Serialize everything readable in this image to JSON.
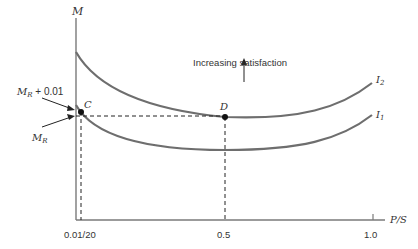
{
  "diagram": {
    "y_axis_label": "M",
    "x_axis_label": "P/S",
    "x_ticks": [
      {
        "label": "0.01/20"
      },
      {
        "label": "0.5"
      },
      {
        "label": "1.0"
      }
    ],
    "y_annotations": [
      {
        "label_main": "M",
        "label_sub": "R",
        "label_suffix": " + 0.01"
      },
      {
        "label_main": "M",
        "label_sub": "R",
        "label_suffix": ""
      }
    ],
    "curves": [
      {
        "name": "I",
        "sub": "2"
      },
      {
        "name": "I",
        "sub": "1"
      }
    ],
    "points": [
      {
        "label": "C"
      },
      {
        "label": "D"
      }
    ],
    "annotation": "Increasing satisfaction",
    "colors": {
      "curve": "#6e6e6e",
      "axis": "#7a7a7a",
      "point": "#111111",
      "text": "#333333"
    }
  }
}
